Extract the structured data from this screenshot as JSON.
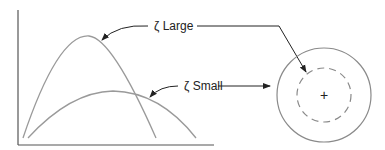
{
  "diagram": {
    "labels": {
      "large": "ζ Large",
      "small": "ζ Small"
    },
    "center_marker": "+",
    "colors": {
      "curve": "#9a9a9a",
      "axis": "#555555",
      "arrow": "#222222",
      "circle": "#8a8a8a"
    }
  }
}
